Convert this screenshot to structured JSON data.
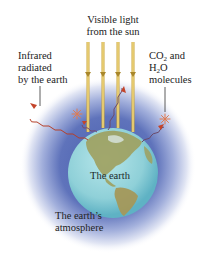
{
  "figure": {
    "labels": {
      "sunlight": {
        "line1": "Visible light",
        "line2": "from the sun"
      },
      "infrared": {
        "line1": "Infrared",
        "line2": "radiated",
        "line3": "by the earth"
      },
      "molecules": {
        "line1_pre": "CO",
        "line1_sub": "2",
        "line1_post": " and",
        "line2_pre": "H",
        "line2_sub": "2",
        "line2_post": "O",
        "line3": "molecules"
      },
      "earth": "The earth",
      "atmosphere": {
        "line1": "The earth’s",
        "line2": "atmosphere"
      }
    },
    "colors": {
      "sun_ray": "#d9b84a",
      "infrared": "#b5402a",
      "infrared_tail": "#6b4a6a",
      "ocean": "#8fd0d8",
      "land": "#9a9a5a",
      "atmosphere": "#5a6fb8",
      "molecule": "#e07a50"
    }
  }
}
